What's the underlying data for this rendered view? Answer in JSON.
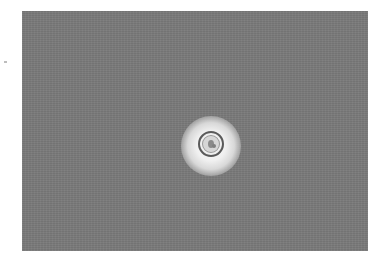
{
  "image": {
    "description": "Phase-contrast micrograph of a single round cell with bright halo on gray background",
    "colors": {
      "background": "#7a7a7a",
      "halo": "#f5f5f5",
      "cell_border": "#5a5a5a",
      "page": "#ffffff"
    }
  }
}
